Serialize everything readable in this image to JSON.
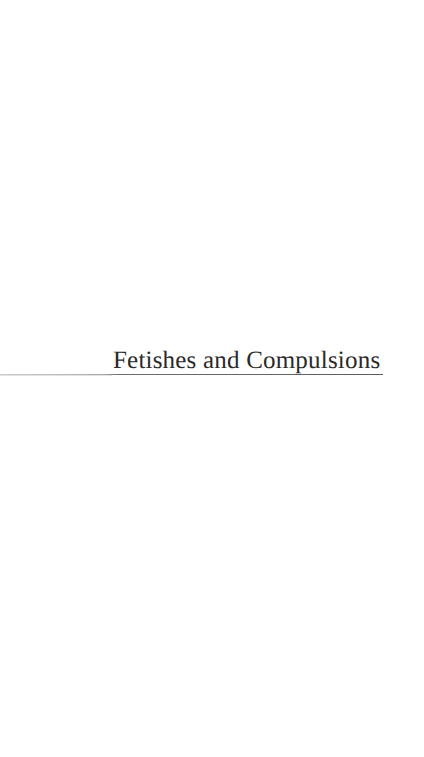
{
  "page": {
    "kind": "book-part-title-page",
    "background_color": "#ffffff",
    "width_px": 424,
    "height_px": 757
  },
  "part_title": {
    "heading": "Fetishes and Compulsions",
    "text_color": "#2b2a28",
    "rule_color": "#5c5c5c",
    "rule_color_left": "#c9c9c9"
  }
}
